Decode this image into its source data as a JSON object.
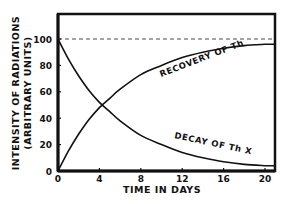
{
  "chart_data": {
    "type": "line",
    "title": "",
    "xlabel": "TIME IN DAYS",
    "ylabel": "INTENSITY OF RADIATIONS",
    "ylabel_sub": "(ARBITRARY UNITS)",
    "xlim": [
      0,
      20
    ],
    "ylim": [
      0,
      100
    ],
    "x_ticks": [
      0,
      4,
      8,
      12,
      16,
      20
    ],
    "x_tick_labels": [
      "0",
      "4",
      "8",
      "12",
      "16",
      "20"
    ],
    "y_ticks": [
      0,
      20,
      40,
      60,
      80,
      100
    ],
    "y_tick_labels": [
      "0",
      "20",
      "40",
      "60",
      "80",
      "100"
    ],
    "grid": false,
    "reference_line": {
      "y": 100,
      "style": "dashed"
    },
    "x": [
      0,
      1,
      2,
      3,
      4,
      5,
      6,
      8,
      10,
      12,
      14,
      16,
      18,
      20
    ],
    "series": [
      {
        "name": "Decay of Th X",
        "values": [
          100,
          85,
          72,
          61,
          52,
          45,
          38,
          27,
          20,
          14,
          10,
          7,
          5,
          4
        ]
      },
      {
        "name": "Recovery of Th",
        "values": [
          0,
          15,
          28,
          39,
          48,
          55,
          62,
          73,
          80,
          86,
          90,
          93,
          95,
          96
        ]
      }
    ],
    "annotations": [
      {
        "text": "RECOVERY OF Th",
        "near_series": "Recovery of Th"
      },
      {
        "text": "DECAY OF Th X",
        "near_series": "Decay of Th X"
      }
    ],
    "intersection": {
      "x": 4.3,
      "y": 50
    }
  }
}
